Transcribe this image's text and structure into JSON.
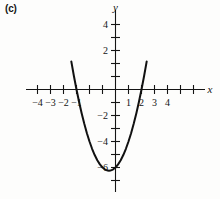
{
  "figure": {
    "panel_label": "(c)",
    "axis_x_name": "x",
    "axis_y_name": "y"
  },
  "chart_data": {
    "type": "line",
    "title": "",
    "subtitle": "",
    "xlabel": "x",
    "ylabel": "y",
    "xlim": [
      -4.7,
      4.7
    ],
    "ylim": [
      -7.2,
      5.2
    ],
    "grid": false,
    "legend": null,
    "x_ticks": [
      -4,
      -3,
      -2,
      -1,
      1,
      2,
      3,
      4
    ],
    "x_tick_labels": [
      "−4",
      "−3",
      "−2",
      "−1",
      "1",
      "2",
      "3",
      "4"
    ],
    "x_minor_ticks": [
      -4,
      -3,
      -2,
      -1,
      0,
      1,
      2,
      3,
      4
    ],
    "y_ticks": [
      4,
      2,
      -2,
      -4,
      -6
    ],
    "y_tick_labels": [
      "4",
      "2",
      "−2",
      "−4",
      "−6"
    ],
    "y_minor_ticks": [
      5,
      4,
      3,
      2,
      1,
      -1,
      -2,
      -3,
      -4,
      -5,
      -6,
      -7
    ],
    "series": [
      {
        "name": "parabola",
        "equation": "y = x^2 + x - 6",
        "color": "#111111",
        "vertex": [
          -0.5,
          -6.25
        ],
        "roots": [
          -3,
          2
        ],
        "y_intercept": -6,
        "x": [
          -3.4,
          -3.2,
          -3.0,
          -2.8,
          -2.6,
          -2.4,
          -2.2,
          -2.0,
          -1.8,
          -1.6,
          -1.4,
          -1.2,
          -1.0,
          -0.8,
          -0.6,
          -0.5,
          -0.4,
          -0.2,
          0.0,
          0.2,
          0.4,
          0.6,
          0.8,
          1.0,
          1.2,
          1.4,
          1.6,
          1.8,
          2.0,
          2.2,
          2.4
        ],
        "y": [
          2.16,
          1.04,
          0.0,
          -0.96,
          -1.84,
          -2.64,
          -3.36,
          -4.0,
          -4.56,
          -5.04,
          -5.44,
          -5.76,
          -6.0,
          -6.16,
          -6.24,
          -6.25,
          -6.24,
          -6.16,
          -6.0,
          -5.76,
          -5.44,
          -5.04,
          -4.56,
          -4.0,
          -3.36,
          -2.64,
          -1.84,
          -0.96,
          0.0,
          1.04,
          2.16
        ]
      }
    ]
  }
}
